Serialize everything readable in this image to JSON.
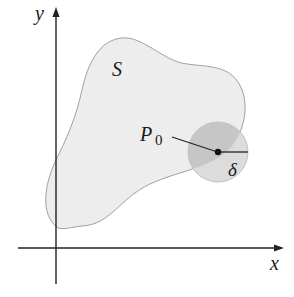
{
  "diagram": {
    "type": "region-with-neighborhood",
    "axes": {
      "x_label": "x",
      "y_label": "y"
    },
    "region": {
      "label": "S"
    },
    "point": {
      "label": "P",
      "subscript": "0"
    },
    "neighborhood": {
      "radius_label": "δ"
    },
    "colors": {
      "region_fill": "#ededed",
      "region_stroke": "#9a9a9a",
      "disk_fill": "#d6d6d6",
      "disk_overlap_fill": "#c4c4c4",
      "axis": "#222222",
      "point": "#111111"
    }
  }
}
